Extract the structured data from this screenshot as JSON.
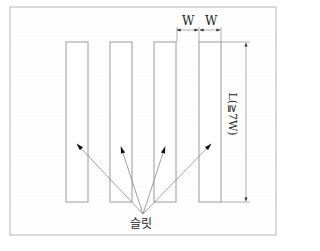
{
  "diagram": {
    "frame": {
      "x": 10,
      "y": 7,
      "w": 266,
      "h": 228
    },
    "slits": [
      {
        "x": 66,
        "y": 42,
        "w": 22,
        "h": 160
      },
      {
        "x": 110,
        "y": 42,
        "w": 22,
        "h": 160
      },
      {
        "x": 154,
        "y": 42,
        "w": 22,
        "h": 160
      },
      {
        "x": 199,
        "y": 42,
        "w": 22,
        "h": 160
      }
    ],
    "labels": {
      "width_1": "W",
      "width_2": "W",
      "length": "L(≧7W)",
      "slit": "슬릿"
    },
    "arrow_origin": {
      "x": 143,
      "y": 214
    },
    "arrow_targets": [
      {
        "x": 77,
        "y": 144
      },
      {
        "x": 121,
        "y": 147
      },
      {
        "x": 165,
        "y": 147
      },
      {
        "x": 211,
        "y": 144
      }
    ],
    "colors": {
      "line": "#9a9a9a",
      "frame": "#b5b5b5",
      "dots": "#d8d8d8",
      "arrow": "#111111"
    }
  }
}
